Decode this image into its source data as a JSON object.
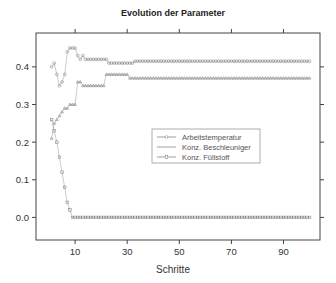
{
  "chart_data": {
    "type": "line",
    "title": "Evolution der Parameter",
    "xlabel": "Schritte",
    "ylabel": "",
    "xlim": [
      -5,
      104
    ],
    "ylim": [
      -0.06,
      0.49
    ],
    "xticks": [
      10,
      30,
      50,
      70,
      90
    ],
    "yticks": [
      0.0,
      0.1,
      0.2,
      0.3,
      0.4
    ],
    "ytick_labels": [
      "0.0",
      "0.1",
      "0.2",
      "0.3",
      "0.4"
    ],
    "xtick_labels": [
      "10",
      "30",
      "50",
      "70",
      "90"
    ],
    "legend": {
      "position": "center-right",
      "entries": [
        "Arbeitstemperatur",
        "Konz. Beschleuniger",
        "Konz. Füllstoff"
      ]
    },
    "series": [
      {
        "name": "Arbeitstemperatur",
        "x": [
          1,
          2,
          3,
          4,
          5,
          6,
          7,
          8,
          9,
          10,
          11,
          12,
          13,
          14,
          15,
          16,
          17,
          18,
          19,
          20,
          21,
          22,
          23,
          24,
          25,
          26,
          27,
          28,
          29,
          30,
          31,
          32,
          33,
          34,
          35,
          36,
          37,
          38,
          39,
          40,
          41,
          42,
          43,
          44,
          45,
          46,
          47,
          48,
          49,
          50,
          51,
          52,
          53,
          54,
          55,
          56,
          57,
          58,
          59,
          60,
          61,
          62,
          63,
          64,
          65,
          66,
          67,
          68,
          69,
          70,
          71,
          72,
          73,
          74,
          75,
          76,
          77,
          78,
          79,
          80,
          81,
          82,
          83,
          84,
          85,
          86,
          87,
          88,
          89,
          90,
          91,
          92,
          93,
          94,
          95,
          96,
          97,
          98,
          99,
          100
        ],
        "y": [
          0.4,
          0.41,
          0.38,
          0.35,
          0.36,
          0.38,
          0.44,
          0.45,
          0.45,
          0.45,
          0.43,
          0.42,
          0.43,
          0.42,
          0.42,
          0.42,
          0.42,
          0.42,
          0.42,
          0.42,
          0.42,
          0.42,
          0.41,
          0.41,
          0.41,
          0.41,
          0.41,
          0.41,
          0.41,
          0.41,
          0.41,
          0.41,
          0.415,
          0.415,
          0.415,
          0.415,
          0.415,
          0.415,
          0.415,
          0.415,
          0.415,
          0.415,
          0.415,
          0.415,
          0.415,
          0.415,
          0.415,
          0.415,
          0.415,
          0.415,
          0.415,
          0.415,
          0.415,
          0.415,
          0.415,
          0.415,
          0.415,
          0.415,
          0.415,
          0.415,
          0.415,
          0.415,
          0.415,
          0.415,
          0.415,
          0.415,
          0.415,
          0.415,
          0.415,
          0.415,
          0.415,
          0.415,
          0.415,
          0.415,
          0.415,
          0.415,
          0.415,
          0.415,
          0.415,
          0.415,
          0.415,
          0.415,
          0.415,
          0.415,
          0.415,
          0.415,
          0.415,
          0.415,
          0.415,
          0.415,
          0.415,
          0.415,
          0.415,
          0.415,
          0.415,
          0.415,
          0.415,
          0.415,
          0.415,
          0.415
        ]
      },
      {
        "name": "Konz. Beschleuniger",
        "x": [
          1,
          2,
          3,
          4,
          5,
          6,
          7,
          8,
          9,
          10,
          11,
          12,
          13,
          14,
          15,
          16,
          17,
          18,
          19,
          20,
          21,
          22,
          23,
          24,
          25,
          26,
          27,
          28,
          29,
          30,
          31,
          32,
          33,
          34,
          35,
          36,
          37,
          38,
          39,
          40,
          41,
          42,
          43,
          44,
          45,
          46,
          47,
          48,
          49,
          50,
          51,
          52,
          53,
          54,
          55,
          56,
          57,
          58,
          59,
          60,
          61,
          62,
          63,
          64,
          65,
          66,
          67,
          68,
          69,
          70,
          71,
          72,
          73,
          74,
          75,
          76,
          77,
          78,
          79,
          80,
          81,
          82,
          83,
          84,
          85,
          86,
          87,
          88,
          89,
          90,
          91,
          92,
          93,
          94,
          95,
          96,
          97,
          98,
          99,
          100
        ],
        "y": [
          0.21,
          0.25,
          0.26,
          0.27,
          0.28,
          0.29,
          0.29,
          0.3,
          0.3,
          0.3,
          0.36,
          0.36,
          0.35,
          0.35,
          0.35,
          0.35,
          0.35,
          0.35,
          0.35,
          0.35,
          0.35,
          0.38,
          0.38,
          0.38,
          0.38,
          0.38,
          0.38,
          0.38,
          0.38,
          0.38,
          0.37,
          0.37,
          0.37,
          0.37,
          0.37,
          0.37,
          0.37,
          0.37,
          0.37,
          0.37,
          0.37,
          0.37,
          0.37,
          0.37,
          0.37,
          0.37,
          0.37,
          0.37,
          0.37,
          0.37,
          0.37,
          0.37,
          0.37,
          0.37,
          0.37,
          0.37,
          0.37,
          0.37,
          0.37,
          0.37,
          0.37,
          0.37,
          0.37,
          0.37,
          0.37,
          0.37,
          0.37,
          0.37,
          0.37,
          0.37,
          0.37,
          0.37,
          0.37,
          0.37,
          0.37,
          0.37,
          0.37,
          0.37,
          0.37,
          0.37,
          0.37,
          0.37,
          0.37,
          0.37,
          0.37,
          0.37,
          0.37,
          0.37,
          0.37,
          0.37,
          0.37,
          0.37,
          0.37,
          0.37,
          0.37,
          0.37,
          0.37,
          0.37,
          0.37,
          0.37
        ]
      },
      {
        "name": "Konz. Füllstoff",
        "x": [
          1,
          2,
          3,
          4,
          5,
          6,
          7,
          8,
          9,
          10,
          11,
          12,
          13,
          14,
          15,
          16,
          17,
          18,
          19,
          20,
          21,
          22,
          23,
          24,
          25,
          26,
          27,
          28,
          29,
          30,
          31,
          32,
          33,
          34,
          35,
          36,
          37,
          38,
          39,
          40,
          41,
          42,
          43,
          44,
          45,
          46,
          47,
          48,
          49,
          50,
          51,
          52,
          53,
          54,
          55,
          56,
          57,
          58,
          59,
          60,
          61,
          62,
          63,
          64,
          65,
          66,
          67,
          68,
          69,
          70,
          71,
          72,
          73,
          74,
          75,
          76,
          77,
          78,
          79,
          80,
          81,
          82,
          83,
          84,
          85,
          86,
          87,
          88,
          89,
          90,
          91,
          92,
          93,
          94,
          95,
          96,
          97,
          98,
          99,
          100
        ],
        "y": [
          0.26,
          0.23,
          0.2,
          0.16,
          0.12,
          0.08,
          0.04,
          0.02,
          0.0,
          0.0,
          0.0,
          0.0,
          0.0,
          0.0,
          0.0,
          0.0,
          0.0,
          0.0,
          0.0,
          0.0,
          0.0,
          0.0,
          0.0,
          0.0,
          0.0,
          0.0,
          0.0,
          0.0,
          0.0,
          0.0,
          0.0,
          0.0,
          0.0,
          0.0,
          0.0,
          0.0,
          0.0,
          0.0,
          0.0,
          0.0,
          0.0,
          0.0,
          0.0,
          0.0,
          0.0,
          0.0,
          0.0,
          0.0,
          0.0,
          0.0,
          0.0,
          0.0,
          0.0,
          0.0,
          0.0,
          0.0,
          0.0,
          0.0,
          0.0,
          0.0,
          0.0,
          0.0,
          0.0,
          0.0,
          0.0,
          0.0,
          0.0,
          0.0,
          0.0,
          0.0,
          0.0,
          0.0,
          0.0,
          0.0,
          0.0,
          0.0,
          0.0,
          0.0,
          0.0,
          0.0,
          0.0,
          0.0,
          0.0,
          0.0,
          0.0,
          0.0,
          0.0,
          0.0,
          0.0,
          0.0,
          0.0,
          0.0,
          0.0,
          0.0,
          0.0,
          0.0,
          0.0,
          0.0,
          0.0,
          0.0
        ]
      }
    ]
  }
}
